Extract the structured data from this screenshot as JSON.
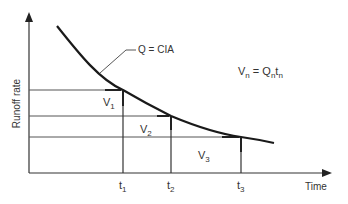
{
  "diagram": {
    "y_axis_label": "Runoff rate",
    "x_axis_label": "Time",
    "curve_label": "Q = CIA",
    "formula": {
      "lhs": "V",
      "lhs_sub": "n",
      "eq": " = ",
      "q": "Q",
      "q_sub": "n",
      "t": "t",
      "t_sub": "n"
    },
    "volumes": [
      {
        "main": "V",
        "sub": "1"
      },
      {
        "main": "V",
        "sub": "2"
      },
      {
        "main": "V",
        "sub": "3"
      }
    ],
    "times": [
      {
        "main": "t",
        "sub": "1"
      },
      {
        "main": "t",
        "sub": "2"
      },
      {
        "main": "t",
        "sub": "3"
      }
    ],
    "colors": {
      "line": "#222222",
      "background": "#ffffff"
    }
  }
}
